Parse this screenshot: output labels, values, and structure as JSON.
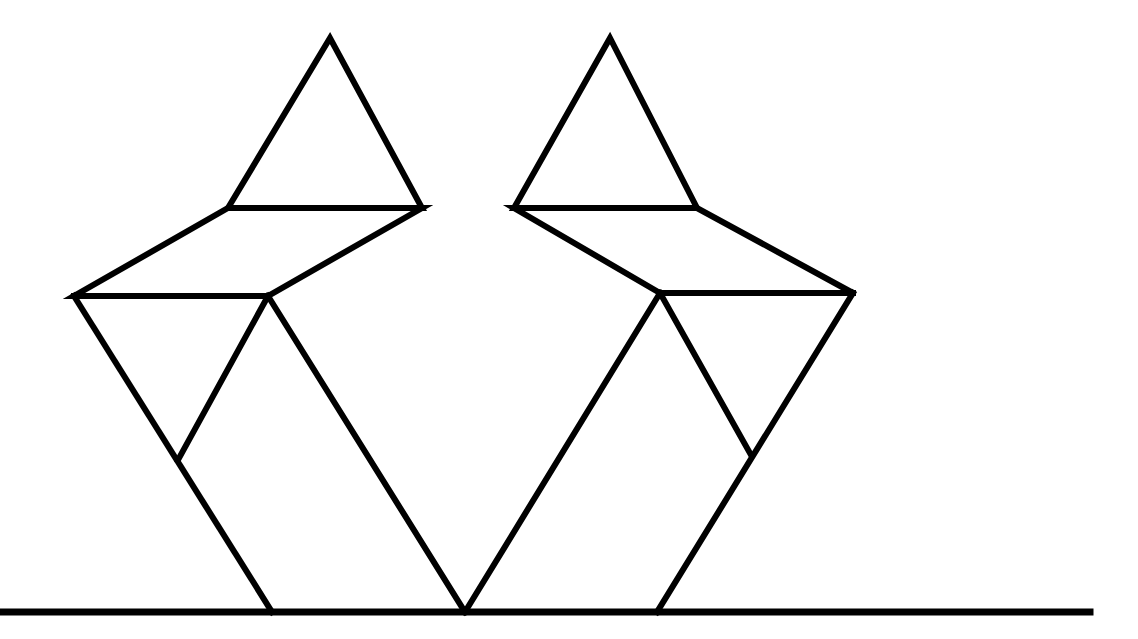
{
  "diagram": {
    "type": "tangram-figures",
    "background": "#ffffff",
    "stroke_color": "#000000",
    "stroke_width": 6,
    "ground_line": {
      "x1": 0,
      "y1": 612,
      "x2": 1090,
      "y2": 612
    },
    "figures": [
      {
        "name": "left-figure",
        "pieces": [
          {
            "name": "head-triangle",
            "points": "330,38 228,208 422,208"
          },
          {
            "name": "shoulder-parallelogram",
            "points": "228,208 422,208 268,296 74,296"
          },
          {
            "name": "left-arm-triangle",
            "points": "74,296 268,296 178,460"
          },
          {
            "name": "lower-left-parallelogram",
            "points": "178,460 268,296 268,296 178,460"
          },
          {
            "name": "body-lines",
            "points": "74,296 272,612"
          },
          {
            "name": "body-right",
            "points": "268,296 465,612"
          }
        ]
      },
      {
        "name": "right-figure",
        "pieces": [
          {
            "name": "head-triangle",
            "points": "610,38 514,208 697,208"
          },
          {
            "name": "shoulder-parallelogram",
            "points": "514,208 697,208 853,293 660,293"
          },
          {
            "name": "right-arm-triangle",
            "points": "660,293 853,293 751,455"
          },
          {
            "name": "body-left",
            "points": "660,293 465,612"
          },
          {
            "name": "body-right",
            "points": "853,293 657,612"
          }
        ]
      }
    ]
  }
}
